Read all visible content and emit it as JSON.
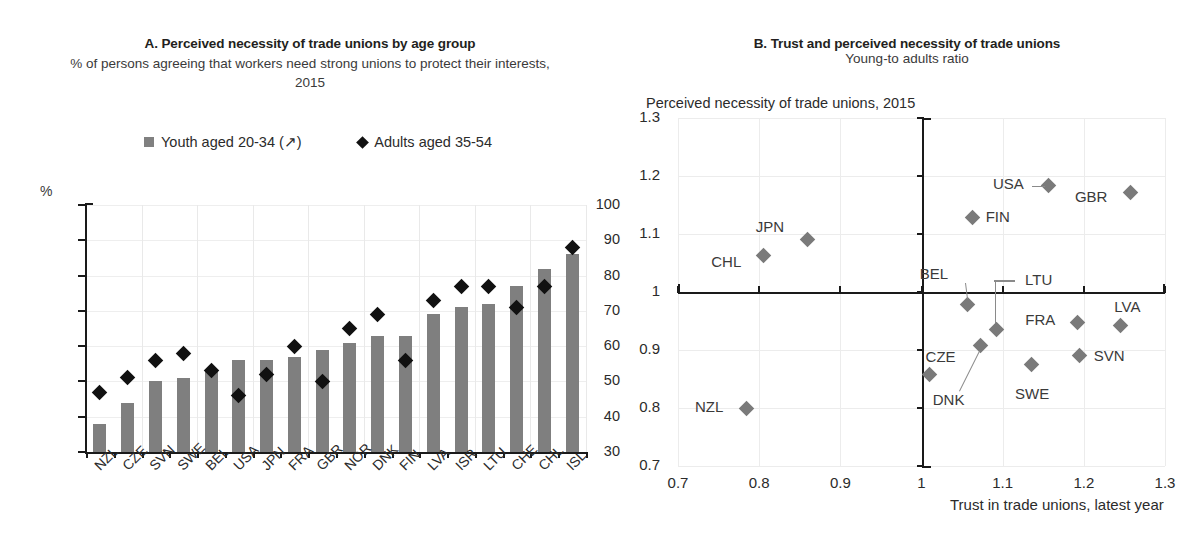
{
  "chart_data": [
    {
      "type": "bar",
      "panel": "A",
      "title": "A. Perceived necessity of trade unions by age group",
      "subtitle": "% of persons agreeing that workers need strong unions to protect their interests, 2015",
      "ylabel": "%",
      "xlabel": "",
      "ylim": [
        30,
        100
      ],
      "yticks": [
        30,
        40,
        50,
        60,
        70,
        80,
        90,
        100
      ],
      "grid": true,
      "legend_position": "top",
      "legend": [
        {
          "label": "Youth aged 20-34 (↗)",
          "marker": "square",
          "color": "#808080"
        },
        {
          "label": "Adults aged 35-54",
          "marker": "diamond",
          "color": "#111111"
        }
      ],
      "categories": [
        "NZL",
        "CZE",
        "SVN",
        "SWE",
        "BEL",
        "USA",
        "JPN",
        "FRA",
        "GBR",
        "NOR",
        "DNK",
        "FIN",
        "LVA",
        "ISR",
        "LTU",
        "CHE",
        "CHL",
        "ISL"
      ],
      "series": [
        {
          "name": "Youth aged 20-34 (↗)",
          "marker": "bar",
          "color": "#7f7f7f",
          "values": [
            38,
            44,
            50,
            51,
            53,
            56,
            56,
            57,
            59,
            61,
            63,
            63,
            69,
            71,
            72,
            77,
            82,
            86
          ]
        },
        {
          "name": "Adults aged 35-54",
          "marker": "diamond",
          "color": "#111111",
          "values": [
            47,
            51,
            56,
            58,
            53,
            46,
            52,
            60,
            50,
            65,
            69,
            56,
            73,
            77,
            77,
            71,
            77,
            88
          ]
        }
      ]
    },
    {
      "type": "scatter",
      "panel": "B",
      "title": "B. Trust and perceived necessity of trade unions",
      "subtitle": "Young-to adults ratio",
      "ylabel": "Perceived necessity of trade unions, 2015",
      "xlabel": "Trust in trade unions, latest year",
      "xlim": [
        0.7,
        1.3
      ],
      "ylim": [
        0.7,
        1.3
      ],
      "xticks": [
        "0.7",
        "0.8",
        "0.9",
        "1",
        "1.1",
        "1.2",
        "1.3"
      ],
      "yticks": [
        "0.7",
        "0.8",
        "0.9",
        "1",
        "1.1",
        "1.2",
        "1.3"
      ],
      "grid": true,
      "axis_origin": [
        1.0,
        1.0
      ],
      "marker": "diamond",
      "marker_color": "#7a7a7a",
      "points": [
        {
          "label": "NZL",
          "x": 0.785,
          "y": 0.8,
          "label_pos": "left"
        },
        {
          "label": "CHL",
          "x": 0.805,
          "y": 1.063,
          "label_pos": "left"
        },
        {
          "label": "JPN",
          "x": 0.86,
          "y": 1.09,
          "label_pos": "left"
        },
        {
          "label": "CZE",
          "x": 1.01,
          "y": 0.857,
          "label_pos": "above-left"
        },
        {
          "label": "BEL",
          "x": 1.057,
          "y": 0.978,
          "label_pos": "above-left",
          "leader": true
        },
        {
          "label": "FIN",
          "x": 1.063,
          "y": 1.128,
          "label_pos": "right"
        },
        {
          "label": "DNK",
          "x": 1.073,
          "y": 0.908,
          "label_pos": "below-left",
          "leader": true
        },
        {
          "label": "LTU",
          "x": 1.093,
          "y": 0.936,
          "label_pos": "above-right",
          "leader": true
        },
        {
          "label": "SWE",
          "x": 1.135,
          "y": 0.875,
          "label_pos": "below"
        },
        {
          "label": "USA",
          "x": 1.157,
          "y": 1.183,
          "label_pos": "left",
          "leader": true
        },
        {
          "label": "FRA",
          "x": 1.192,
          "y": 0.947,
          "label_pos": "left"
        },
        {
          "label": "SVN",
          "x": 1.195,
          "y": 0.89,
          "label_pos": "right"
        },
        {
          "label": "GBR",
          "x": 1.258,
          "y": 1.172,
          "label_pos": "left"
        },
        {
          "label": "LVA",
          "x": 1.245,
          "y": 0.942,
          "label_pos": "above-right"
        }
      ]
    }
  ]
}
